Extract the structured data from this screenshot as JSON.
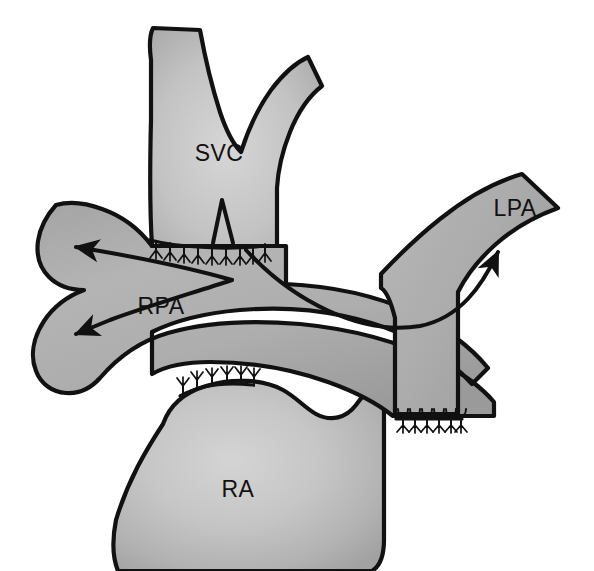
{
  "figure": {
    "background_color": "#ffffff",
    "outline_color": "#111111",
    "vessel_fill_light": "#c9c9c9",
    "vessel_fill_mid": "#b3b3b3",
    "vessel_fill_dark": "#9a9a9a",
    "width": 594,
    "height": 571
  },
  "labels": {
    "svc": "SVC",
    "rpa": "RPA",
    "lpa": "LPA",
    "ra": "RA"
  },
  "label_positions": {
    "svc": {
      "x": 219,
      "y": 161
    },
    "rpa": {
      "x": 161,
      "y": 314
    },
    "lpa": {
      "x": 515,
      "y": 216
    },
    "ra": {
      "x": 238,
      "y": 497
    }
  },
  "structures": [
    {
      "id": "svc",
      "name": "superior-vena-cava",
      "label": "SVC",
      "description": "Superior vena cava with bifurcating innominate/jugular branches at top, transected and anastomosed to the pulmonary artery below"
    },
    {
      "id": "rpa",
      "name": "right-pulmonary-artery",
      "label": "RPA",
      "description": "Right pulmonary artery extending to the left of the figure with upper and lower branch arrows showing bidirectional flow"
    },
    {
      "id": "lpa",
      "name": "left-pulmonary-artery",
      "label": "LPA",
      "description": "Left pulmonary artery sweeping up and to the right with a flow arrow"
    },
    {
      "id": "ra",
      "name": "right-atrium",
      "label": "RA",
      "description": "Right atrium below, with an oversewn suture line at the former cavoatrial junction"
    }
  ],
  "flow_arrows": [
    {
      "id": "rpa-upper-arrow",
      "name": "rpa-upper-flow-arrow",
      "direction": "up-left",
      "vessel": "RPA"
    },
    {
      "id": "rpa-lower-arrow",
      "name": "rpa-lower-flow-arrow",
      "direction": "down-left",
      "vessel": "RPA"
    },
    {
      "id": "lpa-arrow",
      "name": "lpa-flow-arrow",
      "direction": "up-right",
      "vessel": "LPA"
    }
  ],
  "suture_lines": [
    {
      "id": "svc-pa-suture",
      "name": "svc-to-pa-anastomosis-suture",
      "location": "SVC to pulmonary artery anastomosis",
      "stitch_count": 9
    },
    {
      "id": "ra-suture",
      "name": "right-atrium-closure-suture",
      "location": "Right atrial cavoatrial junction closure",
      "stitch_count": 6
    },
    {
      "id": "pa-stump-suture",
      "name": "pa-stump-closure-suture",
      "location": "Divided cardiac end of SVC / PA stump closure",
      "stitch_count": 6
    }
  ]
}
